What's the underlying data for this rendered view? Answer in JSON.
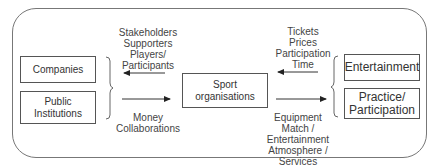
{
  "diagram": {
    "left_boxes": [
      {
        "label": "Companies"
      },
      {
        "label": "Public Institutions"
      }
    ],
    "center_box": {
      "label": "Sport organisations"
    },
    "right_boxes": [
      {
        "label": "Entertainment"
      },
      {
        "label": "Practice/ Participation"
      }
    ],
    "left_top_label": [
      "Stakeholders",
      "Supporters",
      "Players/",
      "Participants"
    ],
    "left_bottom_label": [
      "Money",
      "Collaborations"
    ],
    "right_top_label": [
      "Tickets",
      "Prices",
      "Participation",
      "Time"
    ],
    "right_bottom_label": [
      "Equipment",
      "Match / Entertainment",
      "Atmosphere / Services"
    ]
  }
}
